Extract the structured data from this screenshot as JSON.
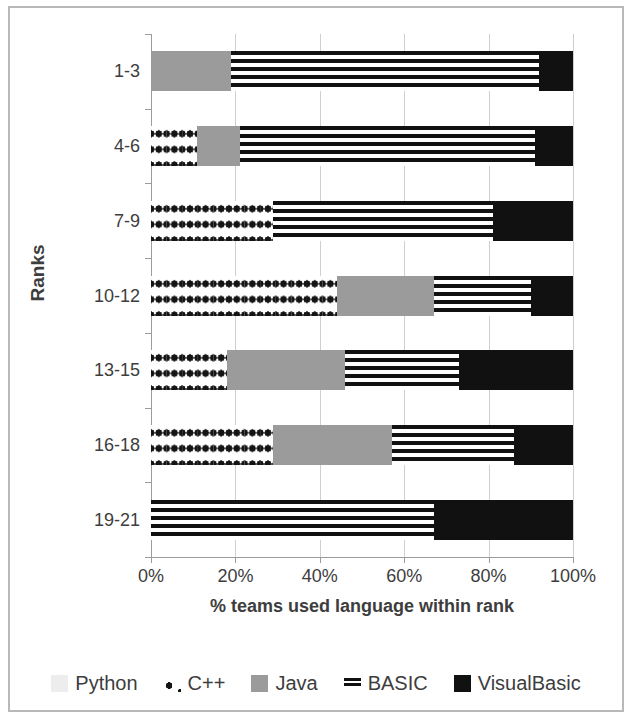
{
  "chart_data": {
    "type": "bar",
    "orientation": "horizontal",
    "stacked": true,
    "stack_mode": "percent",
    "title": "",
    "xlabel": "% teams used language within rank",
    "ylabel": "Ranks",
    "xlim": [
      0,
      100
    ],
    "xticks": [
      0,
      20,
      40,
      60,
      80,
      100
    ],
    "xtick_labels": [
      "0%",
      "20%",
      "40%",
      "60%",
      "80%",
      "100%"
    ],
    "grid": true,
    "grid_axis": "x",
    "legend_position": "bottom",
    "categories": [
      "1-3",
      "4-6",
      "7-9",
      "10-12",
      "13-15",
      "16-18",
      "19-21"
    ],
    "series": [
      {
        "name": "Python",
        "color": "#ededed",
        "pattern": "solid-light",
        "values": [
          0,
          0,
          0,
          0,
          0,
          0,
          0
        ]
      },
      {
        "name": "C++",
        "color": "#141414",
        "pattern": "diamond",
        "values": [
          0,
          11,
          29,
          44,
          18,
          29,
          0
        ]
      },
      {
        "name": "Java",
        "color": "#9b9b9b",
        "pattern": "solid-gray",
        "values": [
          19,
          10,
          0,
          23,
          28,
          28,
          0
        ]
      },
      {
        "name": "BASIC",
        "color": "#111111",
        "pattern": "horizontal-stripes",
        "values": [
          73,
          70,
          52,
          23,
          27,
          29,
          67
        ]
      },
      {
        "name": "VisualBasic",
        "color": "#111111",
        "pattern": "solid-black",
        "values": [
          8,
          9,
          19,
          10,
          27,
          14,
          33
        ]
      }
    ]
  },
  "legend": {
    "items": [
      {
        "label": "Python",
        "swatch": "python-swatch"
      },
      {
        "label": "C++",
        "swatch": "cpp-swatch"
      },
      {
        "label": "Java",
        "swatch": "java-swatch"
      },
      {
        "label": "BASIC",
        "swatch": "basic-swatch"
      },
      {
        "label": "VisualBasic",
        "swatch": "visualbasic-swatch"
      }
    ]
  }
}
